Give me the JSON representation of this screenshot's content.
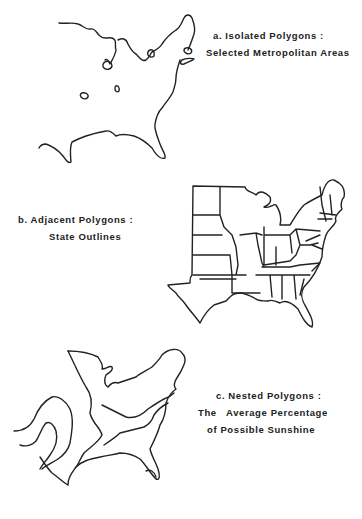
{
  "figure": {
    "panels": [
      {
        "id": "a",
        "title": "a. Isolated Polygons :",
        "subtitle": "Selected Metropolitan Areas",
        "map": "eastern-us-coastline-with-metro-area-polygons"
      },
      {
        "id": "b",
        "title": "b.  Adjacent Polygons :",
        "subtitle": "State Outlines",
        "map": "eastern-us-state-outlines"
      },
      {
        "id": "c",
        "title": "c. Nested Polygons :",
        "subtitle_line1": "The   Average Percentage",
        "subtitle_line2": "of Possible Sunshine",
        "map": "eastern-us-sunshine-isolines"
      }
    ],
    "colors": {
      "background": "#ffffff",
      "ink": "#222222"
    }
  }
}
